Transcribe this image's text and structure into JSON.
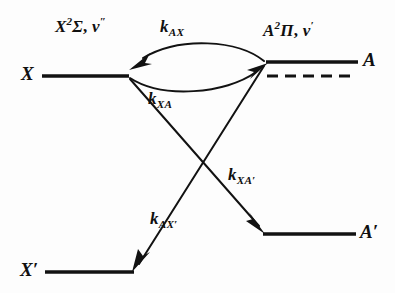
{
  "figure": {
    "type": "energy-level-kinetic-scheme",
    "background_color": "#fdfdfd",
    "line_color": "#121212"
  },
  "states": {
    "X": {
      "label": "X",
      "term": {
        "letter": "X",
        "multiplicity": "2",
        "symmetry": "Σ",
        "vibration": "v",
        "prime": "″"
      },
      "term_label_plain": "X²Σ, v″"
    },
    "A": {
      "label": "A",
      "term": {
        "letter": "A",
        "multiplicity": "2",
        "symmetry": "Π",
        "vibration": "v",
        "prime": "′"
      },
      "term_label_plain": "A²Π, v′"
    },
    "X_prime": {
      "label": "X′"
    },
    "A_prime": {
      "label": "A′"
    }
  },
  "rate_constants": [
    {
      "id": "kAX",
      "base": "k",
      "sub": "AX",
      "plain": "k_AX",
      "from": "A",
      "to": "X",
      "path": "upper-curve"
    },
    {
      "id": "kXA",
      "base": "k",
      "sub": "XA",
      "plain": "k_XA",
      "from": "X",
      "to": "A",
      "path": "lower-curve"
    },
    {
      "id": "kXAp",
      "base": "k",
      "sub": "XA′",
      "plain": "k_XA′",
      "from": "X",
      "to": "A′",
      "path": "straight-down-right"
    },
    {
      "id": "kAXp",
      "base": "k",
      "sub": "AX′",
      "plain": "k_AX′",
      "from": "A",
      "to": "X′",
      "path": "straight-down-left"
    }
  ],
  "levels": [
    {
      "name": "X",
      "kind": "solid",
      "x1": 42,
      "x2": 128,
      "y": 76
    },
    {
      "name": "A",
      "kind": "solid",
      "x1": 266,
      "x2": 358,
      "y": 62
    },
    {
      "name": "A-sublevel",
      "kind": "dashed",
      "x1": 266,
      "x2": 356,
      "y": 76
    },
    {
      "name": "X'",
      "kind": "solid",
      "x1": 45,
      "x2": 133,
      "y": 272
    },
    {
      "name": "A'",
      "kind": "solid",
      "x1": 263,
      "x2": 356,
      "y": 234
    }
  ]
}
